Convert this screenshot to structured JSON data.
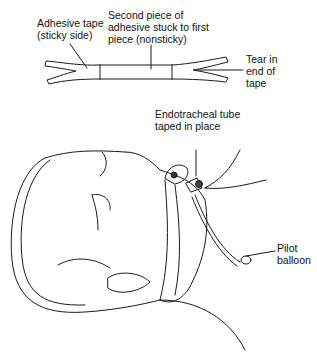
{
  "diagram": {
    "labels": {
      "adhesive_tape": "Adhesive tape\n(sticky side)",
      "second_piece": "Second piece of\nadhesive stuck to first\npiece (nonsticky)",
      "tear": "Tear in\nend of\ntape",
      "ett": "Endotracheal tube\ntaped in place",
      "pilot": "Pilot\nballoon"
    },
    "colors": {
      "line": "#1a1a1a",
      "background": "#ffffff"
    }
  }
}
